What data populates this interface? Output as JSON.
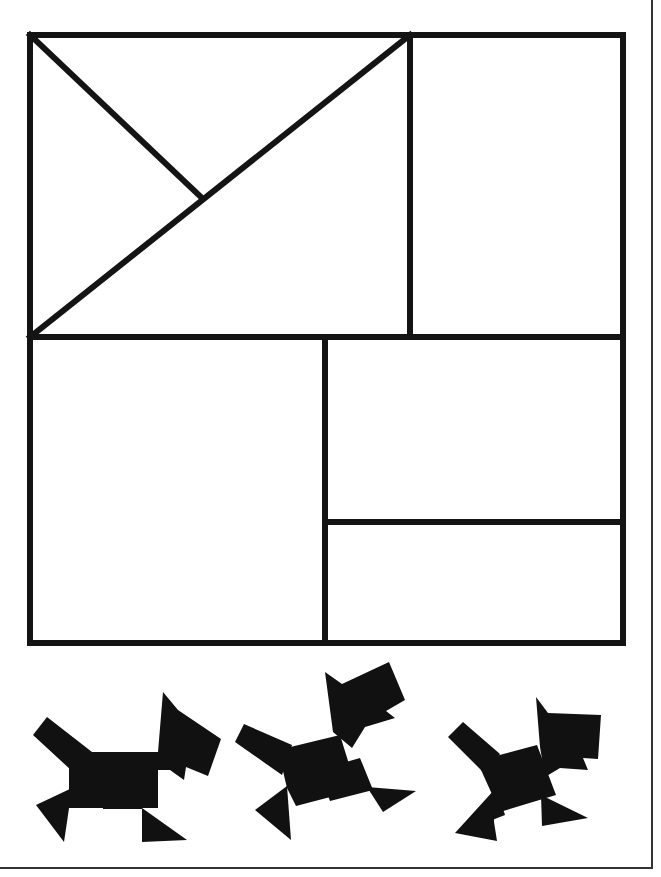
{
  "colors": {
    "background": "#ffffff",
    "stroke": "#141414",
    "fill": "#111111",
    "page_border": "#333333"
  },
  "puzzle": {
    "label": "Tangram square outline",
    "stroke_width": 6,
    "outer_rect": {
      "x": 30,
      "y": 35,
      "width": 593,
      "height": 608
    },
    "lines": [
      {
        "name": "upper-vertical-divider",
        "x1": 410,
        "y1": 35,
        "x2": 410,
        "y2": 337
      },
      {
        "name": "middle-horizontal-divider",
        "x1": 30,
        "y1": 337,
        "x2": 623,
        "y2": 337
      },
      {
        "name": "lower-vertical-divider",
        "x1": 325,
        "y1": 337,
        "x2": 325,
        "y2": 643
      },
      {
        "name": "lower-right-horizontal-divider",
        "x1": 325,
        "y1": 522,
        "x2": 623,
        "y2": 522
      },
      {
        "name": "long-diagonal",
        "x1": 30,
        "y1": 337,
        "x2": 410,
        "y2": 35
      },
      {
        "name": "short-diagonal",
        "x1": 30,
        "y1": 35,
        "x2": 201,
        "y2": 197
      }
    ]
  },
  "figures": [
    {
      "name": "dog-1",
      "pieces": [
        "33,735 47,717 92,752 72,771",
        "69,752 158,752 158,808 69,808",
        "103,788 142,788 142,809 103,809",
        "36,805 72,788 64,842",
        "142,808 142,842 187,840",
        "158,752 163,692 178,710 221,739 208,776 186,767 184,780 170,770 150,770"
      ]
    },
    {
      "name": "dog-2",
      "pieces": [
        "235,742 244,724 292,745 282,775",
        "278,750 340,735 357,790 296,806 287,788",
        "318,770 360,758 373,790 330,801",
        "255,810 287,786 291,840",
        "367,787 383,812 416,791",
        "333,732 325,672 342,684 389,662 405,700 386,711 395,718 365,727 352,748"
      ]
    },
    {
      "name": "dog-3",
      "pieces": [
        "448,737 463,722 500,754 484,773",
        "477,761 537,745 556,795 500,812",
        "496,787 505,815 482,824",
        "495,789 455,833 497,841 494,822",
        "541,795 542,826 588,818",
        "540,747 536,697 548,713 601,715 598,759 583,758 588,770 560,768 545,777"
      ]
    }
  ]
}
